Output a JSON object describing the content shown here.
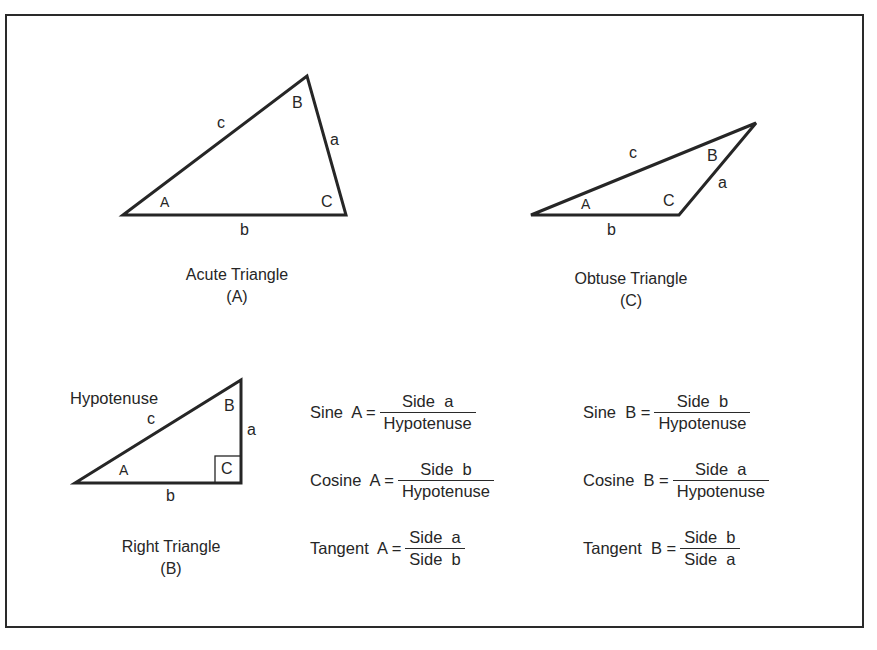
{
  "figures": {
    "acute": {
      "caption": "Acute Triangle",
      "tag": "(A)",
      "vertices": {
        "A": "A",
        "B": "B",
        "C": "C"
      },
      "sides": {
        "a": "a",
        "b": "b",
        "c": "c"
      }
    },
    "obtuse": {
      "caption": "Obtuse Triangle",
      "tag": "(C)",
      "vertices": {
        "A": "A",
        "B": "B",
        "C": "C"
      },
      "sides": {
        "a": "a",
        "b": "b",
        "c": "c"
      }
    },
    "right": {
      "caption": "Right Triangle",
      "tag": "(B)",
      "hypotenuse_label": "Hypotenuse",
      "vertices": {
        "A": "A",
        "B": "B",
        "C": "C"
      },
      "sides": {
        "a": "a",
        "b": "b",
        "c": "c"
      }
    }
  },
  "formulas": {
    "angle_A": [
      {
        "lhs": "Sine  A =",
        "numerator": "Side  a",
        "denominator": "Hypotenuse"
      },
      {
        "lhs": "Cosine  A =",
        "numerator": "Side  b",
        "denominator": "Hypotenuse"
      },
      {
        "lhs": "Tangent  A =",
        "numerator": "Side  a",
        "denominator": "Side  b"
      }
    ],
    "angle_B": [
      {
        "lhs": "Sine  B =",
        "numerator": "Side  b",
        "denominator": "Hypotenuse"
      },
      {
        "lhs": "Cosine  B =",
        "numerator": "Side  a",
        "denominator": "Hypotenuse"
      },
      {
        "lhs": "Tangent  B =",
        "numerator": "Side  b",
        "denominator": "Side  a"
      }
    ]
  },
  "colors": {
    "ink": "#262626",
    "background": "#ffffff"
  }
}
